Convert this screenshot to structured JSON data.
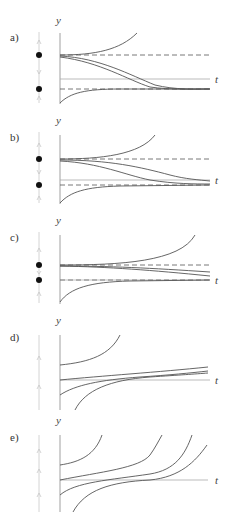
{
  "figure": {
    "colors": {
      "curve": "#555555",
      "axis": "#999999",
      "dashed_equilibrium": "#555555",
      "phase_line": "#cccccc",
      "equilibrium_dot": "#111111"
    },
    "panels": [
      {
        "label": "a)",
        "y_axis_label": "y",
        "t_axis_label": "t",
        "phase_line": {
          "equilibria": [
            "upper",
            "lower"
          ],
          "arrows": [
            "up",
            "down",
            "up"
          ]
        },
        "description": "Upper equilibrium unstable, lower equilibrium stable; solutions start near upper equilibrium and descend to lower one"
      },
      {
        "label": "b)",
        "y_axis_label": "y",
        "t_axis_label": "t",
        "phase_line": {
          "equilibria": [
            "upper",
            "lower"
          ],
          "arrows": [
            "up",
            "down",
            "up"
          ]
        },
        "description": "Similar to a) with equilibria closer together; two solutions drift slowly toward lower equilibrium"
      },
      {
        "label": "c)",
        "y_axis_label": "y",
        "t_axis_label": "t",
        "phase_line": {
          "equilibria": [
            "upper",
            "lower"
          ],
          "arrows": [
            "up",
            "down",
            "up"
          ]
        },
        "description": "Equilibria very close; solutions between them drift slowly downward"
      },
      {
        "label": "d)",
        "y_axis_label": "y",
        "t_axis_label": "t",
        "phase_line": {
          "equilibria": [],
          "arrows": [
            "up",
            "up"
          ]
        },
        "description": "No equilibria; solutions increase slowly near t-axis, faster above"
      },
      {
        "label": "e)",
        "y_axis_label": "y",
        "t_axis_label": "t",
        "phase_line": {
          "equilibria": [],
          "arrows": [
            "up",
            "up",
            "up"
          ]
        },
        "description": "No equilibria; all solutions increase and blow up in finite time"
      }
    ]
  }
}
